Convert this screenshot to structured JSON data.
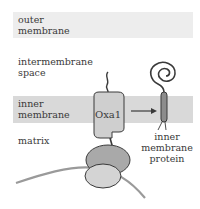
{
  "regions": {
    "outer_membrane": "outer\nmembrane",
    "intermembrane_space": "intermembrane\nspace",
    "inner_membrane": "inner\nmembrane",
    "matrix": "matrix"
  },
  "proteins": {
    "oxa1": "Oxa1",
    "inner_membrane_protein": "inner\nmembrane\nprotein"
  },
  "colors": {
    "outer_band": "#ededed",
    "inner_band": "#d9d9d9",
    "oxa1_fill": "#cfcfcf",
    "ribosome_large": "#a9a9a9",
    "ribosome_small": "#d4d4d4",
    "imp_fill": "#8c8c8c",
    "outline": "#3a3a3a"
  }
}
